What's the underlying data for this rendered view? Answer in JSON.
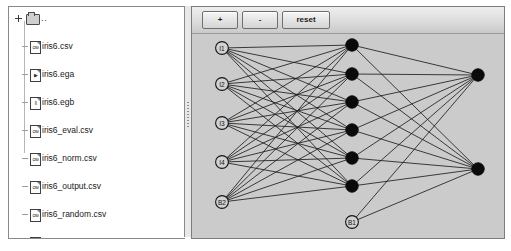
{
  "tree": {
    "root": {
      "label": "..",
      "icon": "folder-icon"
    },
    "items": [
      {
        "label": "iris6.csv",
        "icon": "csv-file-icon",
        "glyph": "csv",
        "selected": false
      },
      {
        "label": "iris6.ega",
        "icon": "ega-file-icon",
        "glyph": "▶",
        "selected": false
      },
      {
        "label": "iris6.egb",
        "icon": "egb-file-icon",
        "glyph": "‖",
        "selected": false
      },
      {
        "label": "iris6_eval.csv",
        "icon": "csv-file-icon",
        "glyph": "csv",
        "selected": false
      },
      {
        "label": "iris6_norm.csv",
        "icon": "csv-file-icon",
        "glyph": "csv",
        "selected": false
      },
      {
        "label": "iris6_output.csv",
        "icon": "csv-file-icon",
        "glyph": "csv",
        "selected": false
      },
      {
        "label": "iris6_random.csv",
        "icon": "csv-file-icon",
        "glyph": "csv",
        "selected": false
      },
      {
        "label": "iris6_train.csv",
        "icon": "csv-file-icon",
        "glyph": "csv",
        "selected": false
      },
      {
        "label": "iris6_train.eg (BasicNetwork)",
        "icon": "eg-file-icon",
        "glyph": "⚓",
        "selected": true
      },
      {
        "label": "iris6_train.egb",
        "icon": "egb-file-icon",
        "glyph": "‖",
        "selected": false
      }
    ]
  },
  "network_panel": {
    "toolbar": {
      "zoom_in_label": "+",
      "zoom_out_label": "-",
      "reset_label": "reset"
    },
    "diagram": {
      "type": "neural-network",
      "layers": [
        {
          "name": "input",
          "style": "open",
          "nodes": [
            {
              "label": "I1",
              "cx": 30,
              "cy": 14
            },
            {
              "label": "I2",
              "cx": 30,
              "cy": 50
            },
            {
              "label": "I3",
              "cx": 30,
              "cy": 89
            },
            {
              "label": "I4",
              "cx": 30,
              "cy": 128
            },
            {
              "label": "B2",
              "cx": 30,
              "cy": 168
            }
          ]
        },
        {
          "name": "hidden",
          "style": "solid",
          "nodes": [
            {
              "label": "",
              "cx": 160,
              "cy": 11
            },
            {
              "label": "",
              "cx": 160,
              "cy": 40
            },
            {
              "label": "",
              "cx": 160,
              "cy": 68
            },
            {
              "label": "",
              "cx": 160,
              "cy": 96
            },
            {
              "label": "",
              "cx": 160,
              "cy": 124
            },
            {
              "label": "",
              "cx": 160,
              "cy": 152
            },
            {
              "label": "B1",
              "cx": 160,
              "cy": 188
            }
          ]
        },
        {
          "name": "output",
          "style": "solid",
          "nodes": [
            {
              "label": "O1",
              "cx": 286,
              "cy": 41
            },
            {
              "label": "O2",
              "cx": 286,
              "cy": 135
            }
          ]
        }
      ]
    }
  },
  "colors": {
    "panel_background": "#cfcfcf",
    "canvas_background": "#cbcbcb",
    "tree_background": "#ffffff",
    "selection": "#808080",
    "edge": "#1e1e1e",
    "solid_node": "#0a0a0a"
  }
}
